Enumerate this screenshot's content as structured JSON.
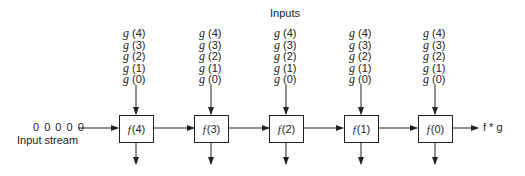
{
  "title": "Inputs",
  "input_stream": {
    "values": "0 0 0 0 0",
    "label": "Input stream"
  },
  "g_inputs": [
    "(4)",
    "(3)",
    "(2)",
    "(1)",
    "(0)"
  ],
  "g_symbol": "g",
  "f_symbol": "f",
  "cells": [
    {
      "arg": "(4)"
    },
    {
      "arg": "(3)"
    },
    {
      "arg": "(2)"
    },
    {
      "arg": "(1)"
    },
    {
      "arg": "(0)"
    }
  ],
  "output_label": "f * g"
}
